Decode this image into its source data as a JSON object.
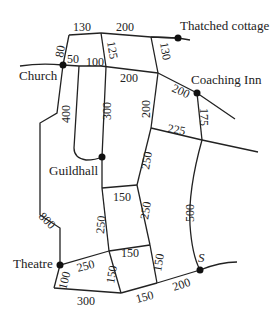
{
  "places": {
    "church": "Church",
    "thatched_cottage": "Thatched cottage",
    "coaching_inn": "Coaching Inn",
    "guildhall": "Guildhall",
    "theatre": "Theatre",
    "s": "S"
  },
  "distances": {
    "top_left_130": "130",
    "top_200": "200",
    "left_80": "80",
    "church_50": "50",
    "church_100": "100",
    "vert_125": "125",
    "vert_130": "130",
    "mid_200": "200",
    "inn_200": "200",
    "loop_400": "400",
    "vert_300": "300",
    "vert_200": "200",
    "cross_225": "225",
    "inn_175": "175",
    "diag_250": "250",
    "outer_800": "800",
    "curve_500": "500",
    "upper_150": "150",
    "left_250": "250",
    "right_250": "250",
    "theatre_250": "250",
    "mid_150": "150",
    "vl_150": "150",
    "vr_150": "150",
    "theatre_100": "100",
    "bottom_300": "300",
    "bottom_150": "150",
    "bottom_200": "200"
  },
  "colors": {
    "road": "#222222",
    "node": "#111111",
    "background": "#ffffff"
  }
}
